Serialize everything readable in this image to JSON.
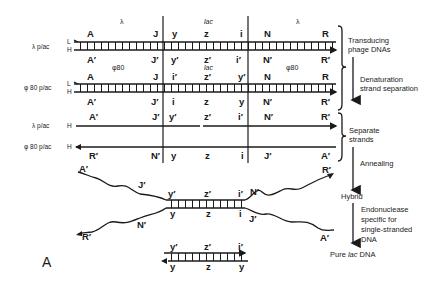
{
  "figure_label": "A",
  "row_labels": {
    "lambda_plac": "λ p/ac",
    "phi80_plac": "φ 80 p/ac",
    "L": "L",
    "H": "H"
  },
  "region_labels": {
    "lambda": "λ",
    "lac": "lac",
    "phi80": "φ80"
  },
  "duplex1": {
    "top": [
      "A",
      "J",
      "y",
      "z",
      "i",
      "N",
      "R"
    ],
    "bottom": [
      "A′",
      "J′",
      "y′",
      "z′",
      "i′",
      "N′",
      "R′"
    ]
  },
  "duplex2": {
    "top": [
      "A",
      "J",
      "i′",
      "z′",
      "y′",
      "N",
      "R"
    ],
    "bottom": [
      "A′",
      "J′",
      "i",
      "z",
      "y",
      "N′",
      "R′"
    ]
  },
  "single1": {
    "labels": [
      "A′",
      "J′",
      "y′",
      "z′",
      "i′",
      "N′",
      "R′"
    ]
  },
  "single2": {
    "labels": [
      "R′",
      "N′",
      "y",
      "z",
      "i",
      "J′",
      "A′"
    ]
  },
  "hybrid": {
    "top_tail": [
      "A′",
      "J′"
    ],
    "top": [
      "y′",
      "z′",
      "i′"
    ],
    "bottom": [
      "y",
      "z",
      "i"
    ],
    "right_top_tail": [
      "N′",
      "R′"
    ],
    "left_bottom_tail": [
      "N′",
      "R′"
    ],
    "right_bottom_tail": [
      "J′",
      "A′"
    ]
  },
  "pure": {
    "top": [
      "y′",
      "z′",
      "i′"
    ],
    "bottom": [
      "y",
      "z",
      "y"
    ]
  },
  "steps": {
    "transducing": [
      "Transducing",
      "phage DNAs"
    ],
    "denaturation": [
      "Denaturation",
      "strand separation"
    ],
    "separate": [
      "Separate",
      "strands"
    ],
    "annealing": "Annealing",
    "hybrid": "Hybrid",
    "endonuclease": [
      "Endonuclease",
      "specific for",
      "single-stranded",
      "DNA"
    ],
    "pure_prefix": "Pure ",
    "pure_lac": "lac",
    "pure_suffix": " DNA"
  }
}
